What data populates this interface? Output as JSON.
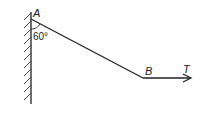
{
  "diagram": {
    "type": "statics-rod-against-wall",
    "labels": {
      "point_a": "A",
      "point_b": "B",
      "force": "T",
      "angle": "60°"
    },
    "colors": {
      "line": "#222222",
      "background": "#ffffff"
    }
  }
}
